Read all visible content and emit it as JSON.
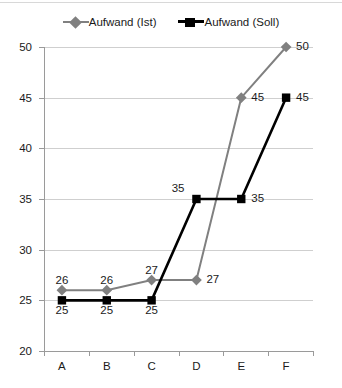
{
  "chart_data": {
    "type": "line",
    "title": "",
    "xlabel": "",
    "ylabel": "",
    "categories": [
      "A",
      "B",
      "C",
      "D",
      "E",
      "F"
    ],
    "ylim": [
      20,
      50
    ],
    "yticks": [
      20,
      25,
      30,
      35,
      40,
      45,
      50
    ],
    "ytick_labels": [
      "20",
      "25",
      "30",
      "35",
      "40",
      "45",
      "50"
    ],
    "grid": true,
    "legend_position": "top-center",
    "series": [
      {
        "name": "Aufwand (Ist)",
        "color": "#808080",
        "marker": "diamond",
        "values": [
          26,
          26,
          27,
          27,
          45,
          50
        ],
        "point_labels": [
          "26",
          "26",
          "27",
          "27",
          "45",
          "50"
        ]
      },
      {
        "name": "Aufwand (Soll)",
        "color": "#000000",
        "marker": "square",
        "values": [
          25,
          25,
          25,
          35,
          35,
          45
        ],
        "point_labels": [
          "25",
          "25",
          "25",
          "35",
          "35",
          "45"
        ]
      }
    ]
  },
  "legend": {
    "items": [
      {
        "label": "Aufwand (Ist)",
        "marker": "diamond-marker-icon"
      },
      {
        "label": "Aufwand (Soll)",
        "marker": "square-marker-icon"
      }
    ]
  }
}
